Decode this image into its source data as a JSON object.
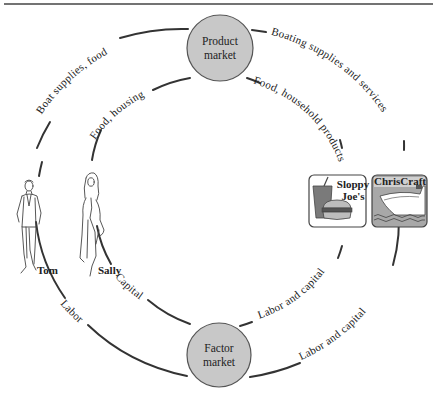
{
  "diagram": {
    "type": "circular-flow",
    "colors": {
      "line": "#333333",
      "market_fill": "#c8c8c8",
      "market_stroke": "#555555",
      "top_rule": "#444444",
      "icon_gray": "#9a9a9a",
      "icon_dark": "#555555"
    },
    "markets": {
      "product": {
        "line1": "Product",
        "line2": "market"
      },
      "factor": {
        "line1": "Factor",
        "line2": "market"
      }
    },
    "households": [
      {
        "name": "Tom",
        "icon": "man-walking-icon"
      },
      {
        "name": "Sally",
        "icon": "woman-walking-icon"
      }
    ],
    "firms": [
      {
        "name_line1": "Sloppy",
        "name_line2": "Joe's",
        "icon": "fast-food-icon"
      },
      {
        "name": "ChrisCraft",
        "icon": "boat-icon"
      }
    ],
    "flows": {
      "outer_top_left": "Boat supplies, food",
      "outer_top_right": "Boating supplies and services",
      "inner_top_left": "Food, housing",
      "inner_top_right": "Food, household products",
      "inner_bottom_left": "Capital",
      "inner_bottom_right": "Labor and capital",
      "outer_bottom_left": "Labor",
      "outer_bottom_right": "Labor and capital"
    }
  }
}
